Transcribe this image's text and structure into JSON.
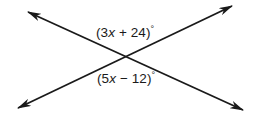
{
  "figure": {
    "name": "intersecting-lines-angle-diagram",
    "background_color": "#ffffff",
    "stroke_color": "#1a1a1a",
    "stroke_width": 1.8,
    "width": 262,
    "height": 122
  },
  "lines": [
    {
      "name": "line-upperleft-to-lowerright",
      "start": {
        "x": 28,
        "y": 12
      },
      "end": {
        "x": 243,
        "y": 110
      },
      "arrow_start": true,
      "arrow_end": true
    },
    {
      "name": "line-lowerleft-to-upperright",
      "start": {
        "x": 18,
        "y": 108
      },
      "end": {
        "x": 232,
        "y": 6
      },
      "arrow_start": true,
      "arrow_end": true
    }
  ],
  "intersection": {
    "x": 129,
    "y": 56
  },
  "labels": {
    "top": {
      "full_text": "(3x + 24)°",
      "prefix": "(3",
      "variable": "x",
      "suffix": " + 24)",
      "degree": "°"
    },
    "bottom": {
      "full_text": "(5x − 12)°",
      "prefix": "(5",
      "variable": "x",
      "suffix": " − 12)",
      "degree": "°"
    }
  }
}
